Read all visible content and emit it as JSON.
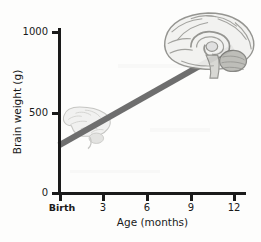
{
  "figure": {
    "background_color": "#fdfdfc",
    "axis_color": "#1a1a1a",
    "line_color": "#6e6e6e"
  },
  "chart_data": {
    "type": "line",
    "title": "",
    "subtitle": "",
    "xlabel": "Age (months)",
    "ylabel": "Brain weight (g)",
    "xlim": [
      0,
      12.8
    ],
    "ylim": [
      0,
      1050
    ],
    "grid": false,
    "legend": false,
    "x_tick_values": [
      0,
      3,
      6,
      9,
      12
    ],
    "x_tick_labels": [
      "Birth",
      "3",
      "6",
      "9",
      "12"
    ],
    "y_tick_values": [
      0,
      500,
      1000
    ],
    "y_tick_labels": [
      "0",
      "500",
      "1000"
    ],
    "series": [
      {
        "name": "Brain weight growth",
        "x": [
          0,
          12
        ],
        "values": [
          290,
          900
        ],
        "color": "#6e6e6e",
        "linewidth": 6
      }
    ],
    "annotations": [
      {
        "name": "infant-brain-illustration",
        "label": "small brain (newborn)",
        "x": 1.6,
        "y": 470
      },
      {
        "name": "toddler-brain-illustration",
        "label": "large brain (12 months)",
        "x": 11.0,
        "y": 940
      }
    ]
  },
  "axes": {
    "y_title": "Brain weight (g)",
    "x_title": "Age (months)",
    "y_ticks": [
      {
        "label": "1000",
        "value": 1000
      },
      {
        "label": "500",
        "value": 500
      },
      {
        "label": "0",
        "value": 0
      }
    ],
    "x_ticks": [
      {
        "label": "Birth",
        "value": 0
      },
      {
        "label": "3",
        "value": 3
      },
      {
        "label": "6",
        "value": 6
      },
      {
        "label": "9",
        "value": 9
      },
      {
        "label": "12",
        "value": 12
      }
    ]
  }
}
